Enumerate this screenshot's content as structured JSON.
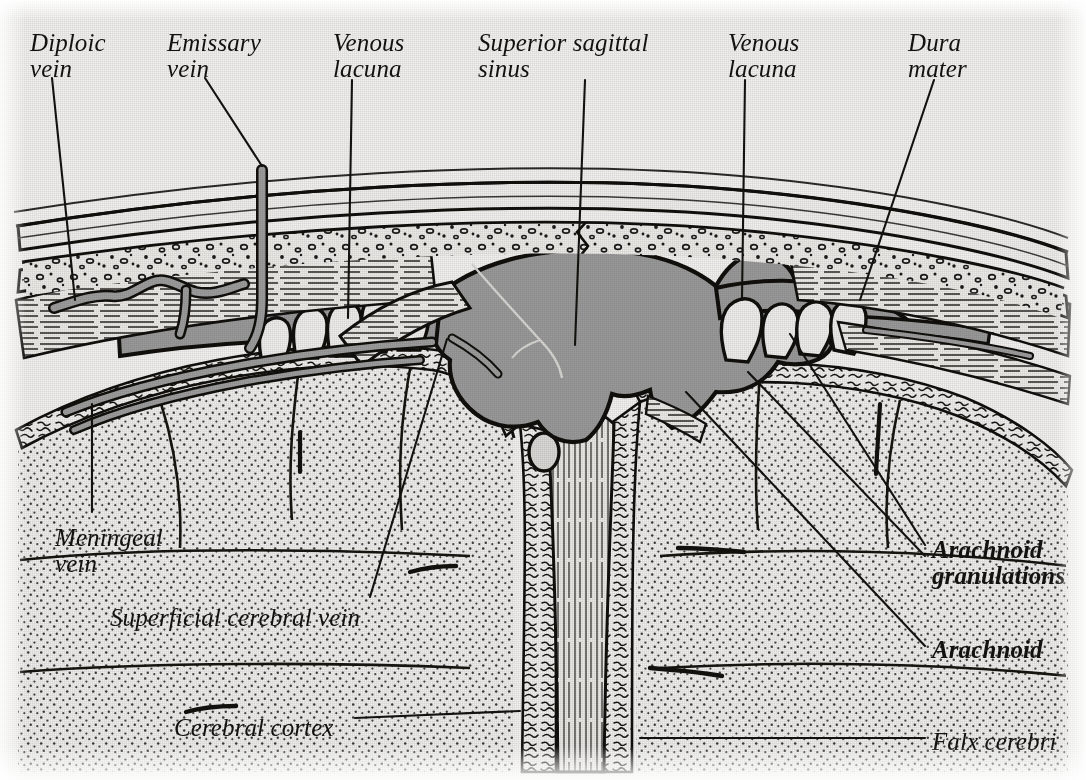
{
  "figure": {
    "type": "anatomical-diagram",
    "background_color": "#f2f1ef",
    "ink_color": "#14120f",
    "sinus_fill_color": "#9a9a9a",
    "vein_fill_color": "#9d9d9d",
    "cortex_fill_color": "#e8e7e4"
  },
  "labels": [
    {
      "id": "diploic-vein",
      "line1": "Diploic",
      "line2": "vein",
      "x": 30,
      "y": 30,
      "align": "left",
      "bold": false
    },
    {
      "id": "emissary-vein",
      "line1": "Emissary",
      "line2": "vein",
      "x": 167,
      "y": 30,
      "align": "left",
      "bold": false
    },
    {
      "id": "venous-lacuna-left",
      "line1": "Venous",
      "line2": "lacuna",
      "x": 333,
      "y": 30,
      "align": "left",
      "bold": false
    },
    {
      "id": "superior-sagittal-sinus",
      "line1": "Superior sagittal",
      "line2": "sinus",
      "x": 478,
      "y": 30,
      "align": "left",
      "bold": false
    },
    {
      "id": "venous-lacuna-right",
      "line1": "Venous",
      "line2": "lacuna",
      "x": 728,
      "y": 30,
      "align": "left",
      "bold": false
    },
    {
      "id": "dura-mater",
      "line1": "Dura",
      "line2": "mater",
      "x": 908,
      "y": 30,
      "align": "left",
      "bold": false
    },
    {
      "id": "meningeal-vein",
      "line1": "Meningeal",
      "line2": "vein",
      "x": 55,
      "y": 525,
      "align": "left",
      "bold": false
    },
    {
      "id": "superficial-cerebral-vein",
      "line1": "Superficial cerebral vein",
      "line2": "",
      "x": 110,
      "y": 605,
      "align": "left",
      "bold": false
    },
    {
      "id": "arachnoid-granulations",
      "line1": "Arachnoid",
      "line2": "granulations",
      "x": 932,
      "y": 537,
      "align": "left",
      "bold": true
    },
    {
      "id": "arachnoid",
      "line1": "Arachnoid",
      "line2": "",
      "x": 932,
      "y": 637,
      "align": "left",
      "bold": true
    },
    {
      "id": "falx-cerebri",
      "line1": "Falx cerebri",
      "line2": "",
      "x": 932,
      "y": 729,
      "align": "left",
      "bold": false
    },
    {
      "id": "cerebral-cortex",
      "line1": "Cerebral cortex",
      "line2": "",
      "x": 174,
      "y": 715,
      "align": "left",
      "bold": false
    }
  ],
  "leader_lines": [
    {
      "id": "leader-diploic-vein",
      "points": "52,78 75,300"
    },
    {
      "id": "leader-emissary-vein",
      "points": "205,78 262,166"
    },
    {
      "id": "leader-venous-lacuna-left",
      "points": "352,80 348,318"
    },
    {
      "id": "leader-superior-sagittal-sinus",
      "points": "585,80 575,345"
    },
    {
      "id": "leader-venous-lacuna-right",
      "points": "745,80 742,300"
    },
    {
      "id": "leader-dura-mater",
      "points": "934,80 860,300"
    },
    {
      "id": "leader-meningeal-vein",
      "points": "92,512 92,404"
    },
    {
      "id": "leader-superficial-cerebral-vein",
      "points": "370,597 447,339"
    },
    {
      "id": "leader-arachnoid-granulations-1",
      "points": "925,545 790,334"
    },
    {
      "id": "leader-arachnoid-granulations-2",
      "points": "925,556 748,372"
    },
    {
      "id": "leader-arachnoid",
      "points": "925,646 686,392"
    },
    {
      "id": "leader-falx-cerebri",
      "points": "925,738 640,738"
    },
    {
      "id": "leader-cerebral-cortex",
      "points": "355,718 520,711"
    }
  ],
  "structures": [
    {
      "id": "scalp-outer-table",
      "name": "Outer table of skull"
    },
    {
      "id": "diploe",
      "name": "Diploe (spongy bone with marrow spaces)"
    },
    {
      "id": "inner-table",
      "name": "Inner table of skull"
    },
    {
      "id": "suture",
      "name": "Cranial suture (zigzag)"
    },
    {
      "id": "dura-mater-fibers",
      "name": "Dura mater fibrous layers"
    },
    {
      "id": "superior-sagittal-sinus-lumen",
      "name": "Superior sagittal sinus lumen"
    },
    {
      "id": "venous-lacuna-left-lumen",
      "name": "Left venous lacuna"
    },
    {
      "id": "venous-lacuna-right-lumen",
      "name": "Right venous lacuna"
    },
    {
      "id": "arachnoid-granulation-cluster-left",
      "name": "Left arachnoid granulation cluster",
      "count": 5
    },
    {
      "id": "arachnoid-granulation-cluster-right",
      "name": "Right arachnoid granulation cluster",
      "count": 4
    },
    {
      "id": "arachnoid-membrane",
      "name": "Arachnoid mater"
    },
    {
      "id": "falx-cerebri-body",
      "name": "Falx cerebri"
    },
    {
      "id": "cerebral-cortex-left",
      "name": "Left cerebral hemisphere cortex"
    },
    {
      "id": "cerebral-cortex-right",
      "name": "Right cerebral hemisphere cortex"
    },
    {
      "id": "diploic-vein-channel",
      "name": "Diploic vein"
    },
    {
      "id": "emissary-vein-channel",
      "name": "Emissary vein"
    },
    {
      "id": "meningeal-vein-channel",
      "name": "Meningeal vein"
    },
    {
      "id": "superficial-cerebral-vein-channel",
      "name": "Superficial cerebral vein"
    },
    {
      "id": "inferior-sagittal-vessels",
      "name": "Subdural vessels in falx"
    }
  ]
}
